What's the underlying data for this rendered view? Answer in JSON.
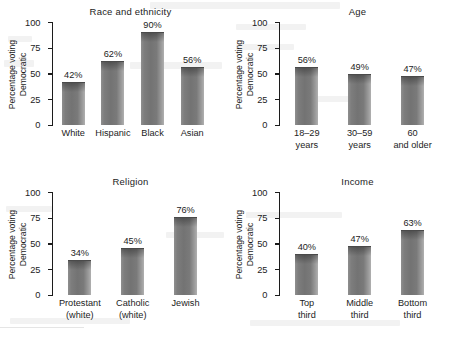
{
  "figure": {
    "ylabel_line1": "Percentage voting",
    "ylabel_line2": "Democratic",
    "y_ticks": [
      "100",
      "75",
      "50",
      "25",
      "0"
    ]
  },
  "chart_data": [
    {
      "type": "bar",
      "title": "Race and ethnicity",
      "categories": [
        "White",
        "Hispanic",
        "Black",
        "Asian"
      ],
      "category_lines": [
        [
          "White"
        ],
        [
          "Hispanic"
        ],
        [
          "Black"
        ],
        [
          "Asian"
        ]
      ],
      "values": [
        42,
        62,
        90,
        56
      ],
      "value_labels": [
        "42%",
        "62%",
        "90%",
        "56%"
      ],
      "xlabel": "",
      "ylabel": "Percentage voting Democratic",
      "ylim": [
        0,
        100
      ],
      "yticks": [
        0,
        25,
        50,
        75,
        100
      ],
      "grid": false,
      "legend": "none"
    },
    {
      "type": "bar",
      "title": "Age",
      "categories": [
        "18–29 years",
        "30–59 years",
        "60 and older"
      ],
      "category_lines": [
        [
          "18–29",
          "years"
        ],
        [
          "30–59",
          "years"
        ],
        [
          "60",
          "and older"
        ]
      ],
      "values": [
        56,
        49,
        47
      ],
      "value_labels": [
        "56%",
        "49%",
        "47%"
      ],
      "xlabel": "",
      "ylabel": "Percentage voting Democratic",
      "ylim": [
        0,
        100
      ],
      "yticks": [
        0,
        25,
        50,
        75,
        100
      ],
      "grid": false,
      "legend": "none"
    },
    {
      "type": "bar",
      "title": "Religion",
      "categories": [
        "Protestant (white)",
        "Catholic (white)",
        "Jewish"
      ],
      "category_lines": [
        [
          "Protestant",
          "(white)"
        ],
        [
          "Catholic",
          "(white)"
        ],
        [
          "Jewish"
        ]
      ],
      "values": [
        34,
        45,
        76
      ],
      "value_labels": [
        "34%",
        "45%",
        "76%"
      ],
      "xlabel": "",
      "ylabel": "Percentage voting Democratic",
      "ylim": [
        0,
        100
      ],
      "yticks": [
        0,
        25,
        50,
        75,
        100
      ],
      "grid": false,
      "legend": "none"
    },
    {
      "type": "bar",
      "title": "Income",
      "categories": [
        "Top third",
        "Middle third",
        "Bottom third"
      ],
      "category_lines": [
        [
          "Top",
          "third"
        ],
        [
          "Middle",
          "third"
        ],
        [
          "Bottom",
          "third"
        ]
      ],
      "values": [
        40,
        47,
        63
      ],
      "value_labels": [
        "40%",
        "47%",
        "63%"
      ],
      "xlabel": "",
      "ylabel": "Percentage voting Democratic",
      "ylim": [
        0,
        100
      ],
      "yticks": [
        0,
        25,
        50,
        75,
        100
      ],
      "grid": false,
      "legend": "none"
    }
  ]
}
